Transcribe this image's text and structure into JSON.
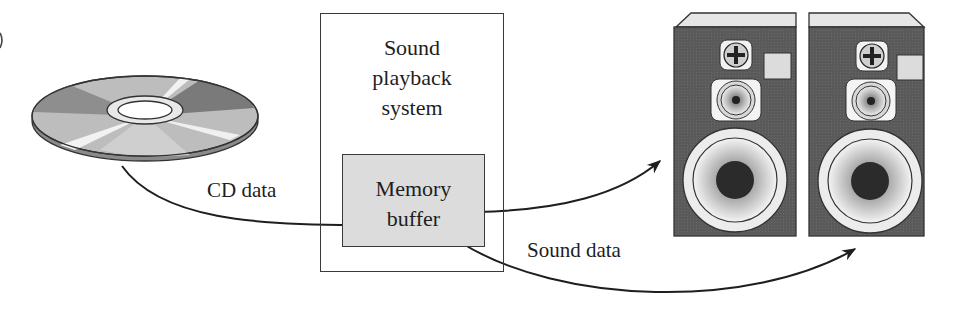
{
  "diagram": {
    "source": {
      "name": "CD",
      "icon": "compact-disc-icon"
    },
    "system": {
      "title_lines": [
        "Sound",
        "playback",
        "system"
      ],
      "buffer": {
        "lines": [
          "Memory",
          "buffer"
        ],
        "fill": "#dcdcdc"
      }
    },
    "outputs": [
      {
        "name": "left speaker",
        "icon": "speaker-icon"
      },
      {
        "name": "right speaker",
        "icon": "speaker-icon"
      }
    ],
    "edges": [
      {
        "from": "CD",
        "to": "Memory buffer",
        "label": "CD data"
      },
      {
        "from": "Memory buffer",
        "to": "left speaker",
        "label": ""
      },
      {
        "from": "Memory buffer",
        "to": "right speaker",
        "label": "Sound data"
      }
    ],
    "colors": {
      "speaker_body": "#555555",
      "speaker_top": "#e6e6e6",
      "line": "#1e1e1e"
    }
  }
}
